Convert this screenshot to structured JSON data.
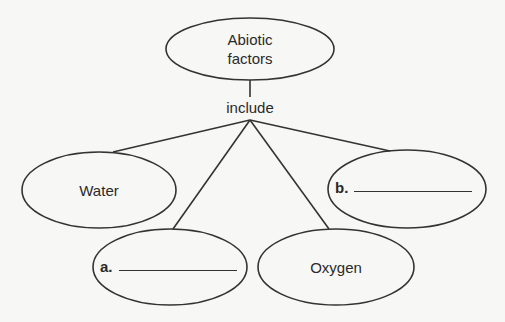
{
  "diagram": {
    "type": "concept-map",
    "root": {
      "label_line1": "Abiotic",
      "label_line2": "factors"
    },
    "connector": "include",
    "children": [
      {
        "id": "water",
        "label": "Water"
      },
      {
        "id": "a",
        "label": "a.",
        "blank": true
      },
      {
        "id": "oxygen",
        "label": "Oxygen"
      },
      {
        "id": "b",
        "label": "b.",
        "blank": true
      }
    ]
  },
  "colors": {
    "stroke": "#333333",
    "background": "#f7f7f5",
    "text": "#2a2a2a"
  }
}
